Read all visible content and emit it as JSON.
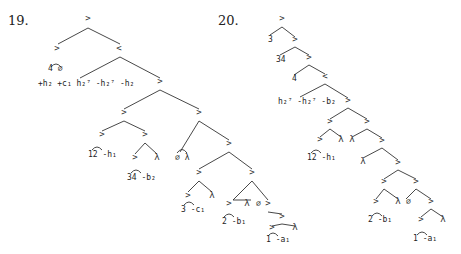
{
  "figures": [
    {
      "number": "19.",
      "nodes": [
        {
          "id": "r",
          "t": ">",
          "x": 88,
          "y": 21
        },
        {
          "id": "a",
          "t": ">",
          "x": 57,
          "y": 51
        },
        {
          "id": "b",
          "t": "<",
          "x": 119,
          "y": 51
        },
        {
          "id": "c",
          "t": ">",
          "x": 160,
          "y": 84
        },
        {
          "id": "d",
          "t": ">",
          "x": 124,
          "y": 115
        },
        {
          "id": "e",
          "t": ">",
          "x": 199,
          "y": 115
        },
        {
          "id": "f",
          "t": ">",
          "x": 102,
          "y": 137
        },
        {
          "id": "g",
          "t": ">",
          "x": 145,
          "y": 137
        },
        {
          "id": "h",
          "t": ">",
          "x": 135,
          "y": 160
        },
        {
          "id": "i",
          "t": "λ",
          "x": 157,
          "y": 160
        },
        {
          "id": "j",
          "t": ">",
          "x": 229,
          "y": 146
        },
        {
          "id": "k",
          "t": ">",
          "x": 199,
          "y": 175
        },
        {
          "id": "l",
          "t": ">",
          "x": 252,
          "y": 175
        },
        {
          "id": "m",
          "t": ">",
          "x": 188,
          "y": 198
        },
        {
          "id": "n",
          "t": "λ",
          "x": 212,
          "y": 198
        },
        {
          "id": "o",
          "t": ">",
          "x": 233,
          "y": 206
        },
        {
          "id": "p",
          "t": ">",
          "x": 268,
          "y": 206
        },
        {
          "id": "q",
          "t": "λ",
          "x": 251,
          "y": 206
        },
        {
          "id": "s",
          "t": ">",
          "x": 282,
          "y": 219
        },
        {
          "id": "u",
          "t": "λ",
          "x": 295,
          "y": 230
        },
        {
          "id": "v",
          "t": ">",
          "x": 272,
          "y": 230
        }
      ],
      "leaf_labels": [
        {
          "t": "4 ∅",
          "x": 48,
          "y": 71
        },
        {
          "t": "+h₂ +c₁ h₂⁷ -h₂⁷ -h₂",
          "x": 38,
          "y": 86
        },
        {
          "t": "12 -h₁",
          "x": 88,
          "y": 157
        },
        {
          "t": "34 -b₂",
          "x": 127,
          "y": 180
        },
        {
          "t": "∅ λ",
          "x": 175,
          "y": 160
        },
        {
          "t": "3 -c₁",
          "x": 181,
          "y": 212
        },
        {
          "t": "2 -b₁",
          "x": 222,
          "y": 224
        },
        {
          "t": "∅",
          "x": 256,
          "y": 206
        },
        {
          "t": "1 -a₁",
          "x": 266,
          "y": 242
        }
      ]
    },
    {
      "number": "20.",
      "nodes": [
        {
          "id": "r",
          "t": ">",
          "x": 282,
          "y": 21
        },
        {
          "id": "a",
          "t": ">",
          "x": 295,
          "y": 42
        },
        {
          "id": "b",
          "t": ">",
          "x": 309,
          "y": 60
        },
        {
          "id": "c",
          "t": "<",
          "x": 325,
          "y": 79
        },
        {
          "id": "d",
          "t": ">",
          "x": 348,
          "y": 103
        },
        {
          "id": "e",
          "t": ">",
          "x": 330,
          "y": 124
        },
        {
          "id": "f",
          "t": ">",
          "x": 367,
          "y": 124
        },
        {
          "id": "g",
          "t": ">",
          "x": 320,
          "y": 142
        },
        {
          "id": "h",
          "t": "λ",
          "x": 341,
          "y": 142
        },
        {
          "id": "i",
          "t": "λ",
          "x": 352,
          "y": 142
        },
        {
          "id": "j",
          "t": ">",
          "x": 382,
          "y": 143
        },
        {
          "id": "k",
          "t": "λ",
          "x": 363,
          "y": 164
        },
        {
          "id": "l",
          "t": ">",
          "x": 398,
          "y": 165
        },
        {
          "id": "m",
          "t": ">",
          "x": 384,
          "y": 184
        },
        {
          "id": "n",
          "t": ">",
          "x": 416,
          "y": 184
        },
        {
          "id": "o",
          "t": ">",
          "x": 376,
          "y": 204
        },
        {
          "id": "p",
          "t": "λ",
          "x": 398,
          "y": 204
        },
        {
          "id": "q",
          "t": ">",
          "x": 431,
          "y": 204
        },
        {
          "id": "s",
          "t": ">",
          "x": 421,
          "y": 222
        },
        {
          "id": "u",
          "t": "λ",
          "x": 443,
          "y": 222
        }
      ],
      "leaf_labels": [
        {
          "t": "3",
          "x": 268,
          "y": 42
        },
        {
          "t": "34",
          "x": 276,
          "y": 62
        },
        {
          "t": "4",
          "x": 292,
          "y": 81
        },
        {
          "t": "h₂⁷ -h₂⁷ -b₂",
          "x": 278,
          "y": 104
        },
        {
          "t": "12 -h₁",
          "x": 307,
          "y": 160
        },
        {
          "t": "∅",
          "x": 406,
          "y": 204
        },
        {
          "t": "2 -b₁",
          "x": 368,
          "y": 222
        },
        {
          "t": "1 -a₁",
          "x": 413,
          "y": 241
        }
      ]
    }
  ]
}
